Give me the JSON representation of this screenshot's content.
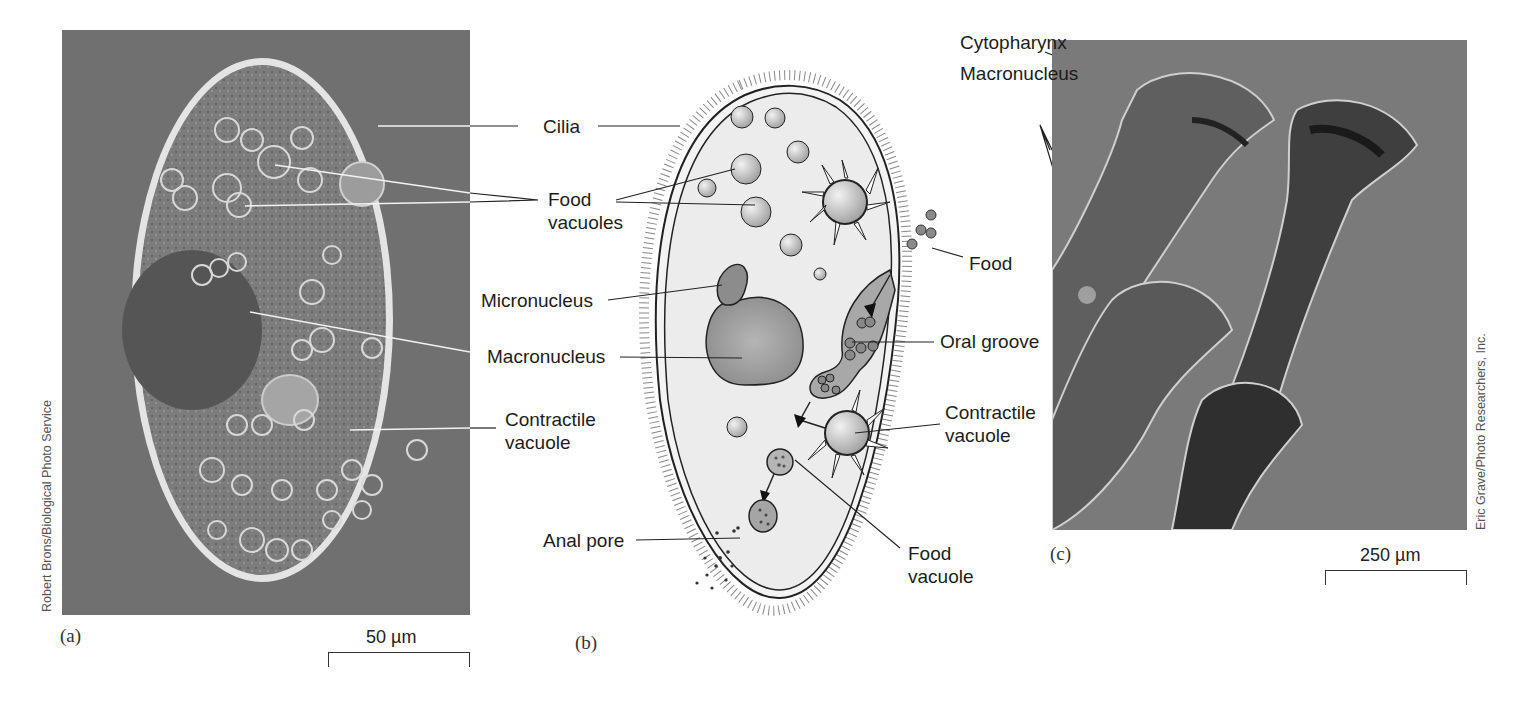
{
  "figure": {
    "panels": [
      {
        "id": "a",
        "letter": "(a)",
        "type": "micrograph",
        "subject": "Paramecium light micrograph",
        "scale_bar": "50 µm",
        "credit": "Robert Brons/Biological Photo Service"
      },
      {
        "id": "b",
        "letter": "(b)",
        "type": "illustration",
        "subject": "Paramecium structure diagram"
      },
      {
        "id": "c",
        "letter": "(c)",
        "type": "micrograph",
        "subject": "Stentor light micrograph",
        "scale_bar": "250 µm",
        "credit": "Eric Grave/Photo Researchers, Inc."
      }
    ],
    "labels_left": {
      "cilia": "Cilia",
      "food_vacuoles_1": "Food",
      "food_vacuoles_2": "vacuoles",
      "micronucleus": "Micronucleus",
      "macronucleus": "Macronucleus",
      "contractile_vacuole_1": "Contractile",
      "contractile_vacuole_2": "vacuole",
      "anal_pore": "Anal pore"
    },
    "labels_right": {
      "food": "Food",
      "oral_groove": "Oral groove",
      "contractile_vacuole_1": "Contractile",
      "contractile_vacuole_2": "vacuole",
      "food_vacuole_1": "Food",
      "food_vacuole_2": "vacuole"
    },
    "labels_c": {
      "cytopharynx": "Cytopharynx",
      "macronucleus": "Macronucleus"
    },
    "colors": {
      "photo_bg": "#6e6e6e",
      "cell_fill": "#ececec",
      "nucleus_fill": "#8f8f8f",
      "outline": "#222222"
    }
  }
}
